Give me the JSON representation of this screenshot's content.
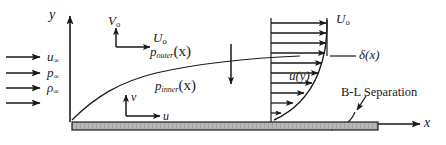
{
  "figure": {
    "type": "boundary-layer-diagram",
    "background": "#ffffff",
    "line_color": "#1a1a1a",
    "plate_fill": "#b5b5b5"
  },
  "axes": {
    "y_axis_label": "y",
    "x_axis_label": "x",
    "origin_x": 70,
    "origin_y": 122
  },
  "freestream": {
    "arrow_count": 4,
    "labels": [
      {
        "base": "u",
        "sub": "∞"
      },
      {
        "base": "p",
        "sub": "∞"
      },
      {
        "base": "ρ",
        "sub": "∞"
      }
    ]
  },
  "velocity_vectors": {
    "label": "V₀-U₀ reference frame",
    "vertical_label_base": "V",
    "vertical_label_sub": "o",
    "horizontal_label_base": "U",
    "horizontal_label_sub": "o"
  },
  "local_coords": {
    "vertical_label": "v",
    "horizontal_label": "u"
  },
  "pressure": {
    "outer_base": "p",
    "outer_sub": "outer",
    "outer_arg": "(x)",
    "inner_base": "p",
    "inner_sub": "inner",
    "inner_arg": "(x)",
    "transfer_arrow": "downward-arrow"
  },
  "profile": {
    "edge_velocity_base": "U",
    "edge_velocity_sub": "o",
    "profile_label_base": "u",
    "profile_label_arg": "(y)",
    "arrow_count": 10
  },
  "annotations": {
    "delta_base": "δ",
    "delta_arg": "(x)",
    "separation_label": "B-L Separation"
  }
}
